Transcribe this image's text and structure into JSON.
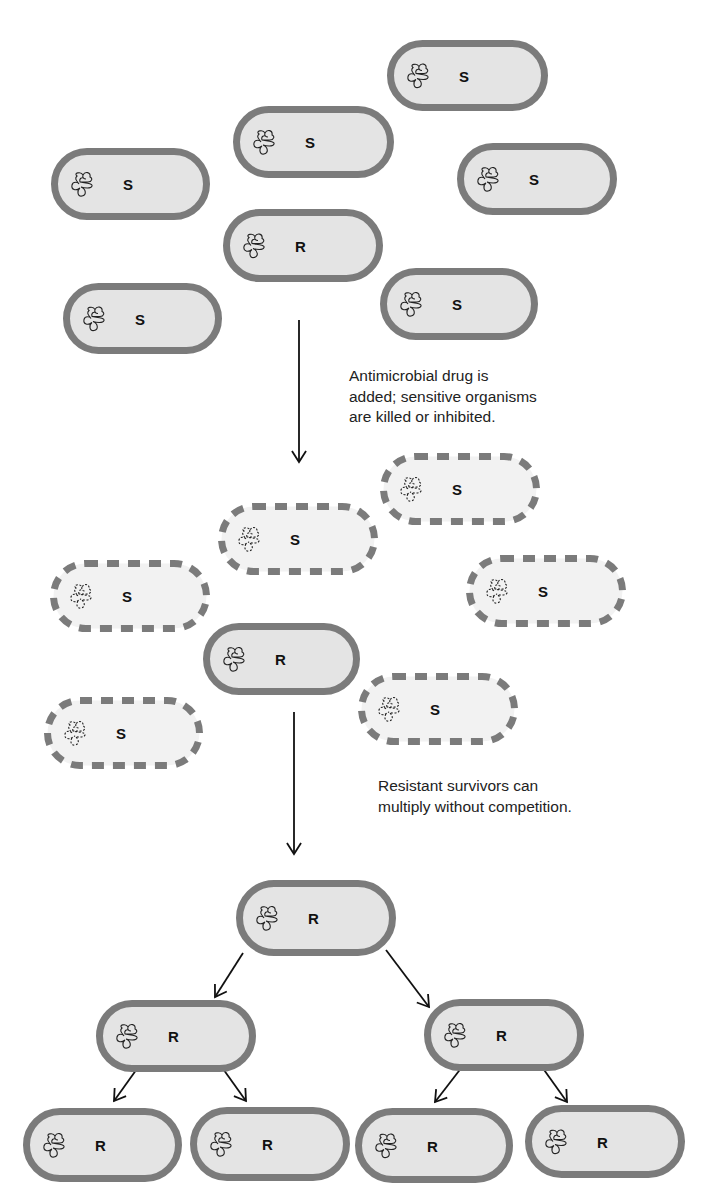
{
  "figure": {
    "colors": {
      "background": "#ffffff",
      "wall": "#7b7b7b",
      "live_fill": "#e4e4e4",
      "dead_fill": "#f2f2f2",
      "chromosome": "#222222",
      "arrow": "#111111",
      "text": "#222222"
    }
  },
  "captions": [
    {
      "id": "step1",
      "x": 349,
      "y": 366,
      "lines": [
        "Antimicrobial drug is",
        "added; sensitive organisms",
        "are killed or inhibited."
      ]
    },
    {
      "id": "step2",
      "x": 378,
      "y": 776,
      "lines": [
        "Resistant survivors can",
        "multiply without competition."
      ]
    }
  ],
  "cells": [
    {
      "stage": "initial",
      "label": "S",
      "x": 387,
      "y": 40,
      "w": 161,
      "h": 71,
      "state": "live"
    },
    {
      "stage": "initial",
      "label": "S",
      "x": 233,
      "y": 106,
      "w": 161,
      "h": 72,
      "state": "live"
    },
    {
      "stage": "initial",
      "label": "S",
      "x": 51,
      "y": 148,
      "w": 159,
      "h": 72,
      "state": "live"
    },
    {
      "stage": "initial",
      "label": "S",
      "x": 457,
      "y": 143,
      "w": 160,
      "h": 72,
      "state": "live"
    },
    {
      "stage": "initial",
      "label": "R",
      "x": 223,
      "y": 209,
      "w": 160,
      "h": 73,
      "state": "live"
    },
    {
      "stage": "initial",
      "label": "S",
      "x": 63,
      "y": 283,
      "w": 159,
      "h": 71,
      "state": "live"
    },
    {
      "stage": "initial",
      "label": "S",
      "x": 380,
      "y": 268,
      "w": 158,
      "h": 72,
      "state": "live"
    },
    {
      "stage": "treated",
      "label": "S",
      "x": 380,
      "y": 453,
      "w": 160,
      "h": 72,
      "state": "dead"
    },
    {
      "stage": "treated",
      "label": "S",
      "x": 218,
      "y": 503,
      "w": 160,
      "h": 72,
      "state": "dead"
    },
    {
      "stage": "treated",
      "label": "S",
      "x": 50,
      "y": 560,
      "w": 160,
      "h": 72,
      "state": "dead"
    },
    {
      "stage": "treated",
      "label": "S",
      "x": 466,
      "y": 555,
      "w": 160,
      "h": 72,
      "state": "dead"
    },
    {
      "stage": "treated",
      "label": "R",
      "x": 203,
      "y": 623,
      "w": 157,
      "h": 72,
      "state": "live"
    },
    {
      "stage": "treated",
      "label": "S",
      "x": 44,
      "y": 697,
      "w": 159,
      "h": 72,
      "state": "dead"
    },
    {
      "stage": "treated",
      "label": "S",
      "x": 358,
      "y": 673,
      "w": 160,
      "h": 72,
      "state": "dead"
    },
    {
      "stage": "growth",
      "label": "R",
      "x": 236,
      "y": 880,
      "w": 160,
      "h": 76,
      "state": "live"
    },
    {
      "stage": "growth",
      "label": "R",
      "x": 96,
      "y": 1000,
      "w": 160,
      "h": 72,
      "state": "live"
    },
    {
      "stage": "growth",
      "label": "R",
      "x": 424,
      "y": 999,
      "w": 160,
      "h": 72,
      "state": "live"
    },
    {
      "stage": "growth",
      "label": "R",
      "x": 23,
      "y": 1108,
      "w": 159,
      "h": 74,
      "state": "live"
    },
    {
      "stage": "growth",
      "label": "R",
      "x": 190,
      "y": 1107,
      "w": 160,
      "h": 74,
      "state": "live"
    },
    {
      "stage": "growth",
      "label": "R",
      "x": 355,
      "y": 1108,
      "w": 158,
      "h": 75,
      "state": "live"
    },
    {
      "stage": "growth",
      "label": "R",
      "x": 525,
      "y": 1105,
      "w": 160,
      "h": 73,
      "state": "live"
    }
  ],
  "arrows": [
    {
      "name": "arrow-drug-added",
      "x1": 299,
      "y1": 320,
      "x2": 299,
      "y2": 462
    },
    {
      "name": "arrow-survivors",
      "x1": 294,
      "y1": 712,
      "x2": 294,
      "y2": 854
    },
    {
      "name": "arrow-divide-left",
      "x1": 243,
      "y1": 953,
      "x2": 215,
      "y2": 997
    },
    {
      "name": "arrow-divide-right",
      "x1": 386,
      "y1": 950,
      "x2": 429,
      "y2": 1007
    },
    {
      "name": "arrow-divide-left-left",
      "x1": 139,
      "y1": 1066,
      "x2": 114,
      "y2": 1101
    },
    {
      "name": "arrow-divide-left-right",
      "x1": 221,
      "y1": 1066,
      "x2": 246,
      "y2": 1101
    },
    {
      "name": "arrow-divide-right-left",
      "x1": 462,
      "y1": 1067,
      "x2": 435,
      "y2": 1102
    },
    {
      "name": "arrow-divide-right-right",
      "x1": 542,
      "y1": 1067,
      "x2": 567,
      "y2": 1102
    }
  ]
}
